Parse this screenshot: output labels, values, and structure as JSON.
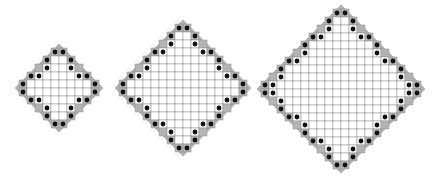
{
  "figure": {
    "colors": {
      "background": "#ffffff",
      "grid_line": "#8c8c8c",
      "cell_fill": "#ffffff",
      "boundary_fill": "#b4b4b4",
      "outline": "#9a9a9a",
      "dot": "#111111"
    },
    "cell_size": 8,
    "diamonds": [
      {
        "name": "small-diamond",
        "order": 5,
        "center_x": 59,
        "center_y": 88
      },
      {
        "name": "medium-diamond",
        "order": 8,
        "center_x": 183,
        "center_y": 88
      },
      {
        "name": "large-diamond",
        "order": 10,
        "center_x": 341,
        "center_y": 89
      }
    ]
  }
}
